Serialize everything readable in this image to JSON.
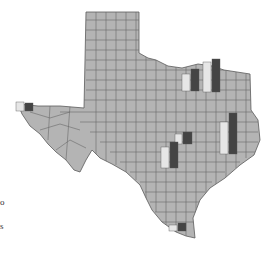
{
  "map": {
    "region": "Texas",
    "fill_color": "#b4b4b4",
    "border_color": "#5a5a5a",
    "bar_colors": {
      "light": "#e6e6e6",
      "dark": "#444444"
    }
  },
  "bars": [
    {
      "name": "el-paso",
      "x": 16,
      "base_y": 111,
      "light_h": 9,
      "dark_h": 8
    },
    {
      "name": "dallas-west",
      "x": 182,
      "base_y": 91,
      "light_h": 17,
      "dark_h": 22
    },
    {
      "name": "dallas-east",
      "x": 203,
      "base_y": 92,
      "light_h": 30,
      "dark_h": 33
    },
    {
      "name": "austin",
      "x": 175,
      "base_y": 144,
      "light_h": 10,
      "dark_h": 12
    },
    {
      "name": "san-antonio",
      "x": 161,
      "base_y": 168,
      "light_h": 21,
      "dark_h": 26
    },
    {
      "name": "houston",
      "x": 220,
      "base_y": 155,
      "light_h": 32,
      "dark_h": 41
    },
    {
      "name": "rio-grande-valley",
      "x": 169,
      "base_y": 231,
      "light_h": 6,
      "dark_h": 8
    }
  ],
  "edge_text": [
    "o",
    "s"
  ]
}
